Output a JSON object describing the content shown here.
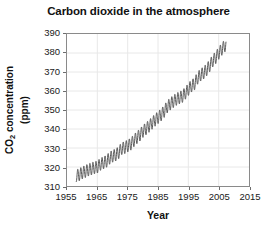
{
  "chart_data": {
    "type": "line",
    "title": "Carbon dioxide in the atmosphere",
    "xlabel": "Year",
    "ylabel_line1": "CO2 concentration",
    "ylabel_line2": "(ppm)",
    "ylabel_main": "CO",
    "ylabel_sub": "2",
    "ylabel_rest": " concentration",
    "xlim": [
      1955,
      2015
    ],
    "ylim": [
      310,
      390
    ],
    "xticks": [
      1955,
      1965,
      1975,
      1985,
      1995,
      2005,
      2015
    ],
    "yticks": [
      310,
      320,
      330,
      340,
      350,
      360,
      370,
      380,
      390
    ],
    "grid": true,
    "legend": null,
    "series_name": "Mauna Loa monthly mean CO2",
    "line_color": "#555555",
    "seasonal_amplitude_ppm": 3.2,
    "x": [
      1958.0,
      1959.0,
      1960.0,
      1961.0,
      1962.0,
      1963.0,
      1964.0,
      1965.0,
      1966.0,
      1967.0,
      1968.0,
      1969.0,
      1970.0,
      1971.0,
      1972.0,
      1973.0,
      1974.0,
      1975.0,
      1976.0,
      1977.0,
      1978.0,
      1979.0,
      1980.0,
      1981.0,
      1982.0,
      1983.0,
      1984.0,
      1985.0,
      1986.0,
      1987.0,
      1988.0,
      1989.0,
      1990.0,
      1991.0,
      1992.0,
      1993.0,
      1994.0,
      1995.0,
      1996.0,
      1997.0,
      1998.0,
      1999.0,
      2000.0,
      2001.0,
      2002.0,
      2003.0,
      2004.0,
      2005.0,
      2006.0,
      2007.0
    ],
    "values": [
      315.3,
      315.9,
      316.9,
      317.6,
      318.4,
      319.0,
      319.6,
      320.0,
      321.4,
      322.2,
      323.0,
      324.6,
      325.7,
      326.3,
      327.5,
      329.7,
      330.2,
      331.1,
      332.0,
      333.8,
      335.4,
      336.8,
      338.7,
      340.1,
      341.4,
      343.0,
      344.6,
      346.0,
      347.4,
      349.2,
      351.6,
      353.1,
      354.4,
      355.6,
      356.4,
      357.1,
      358.8,
      360.8,
      362.6,
      363.7,
      366.7,
      368.4,
      369.5,
      371.1,
      373.2,
      375.8,
      377.5,
      379.8,
      381.9,
      383.8
    ]
  }
}
